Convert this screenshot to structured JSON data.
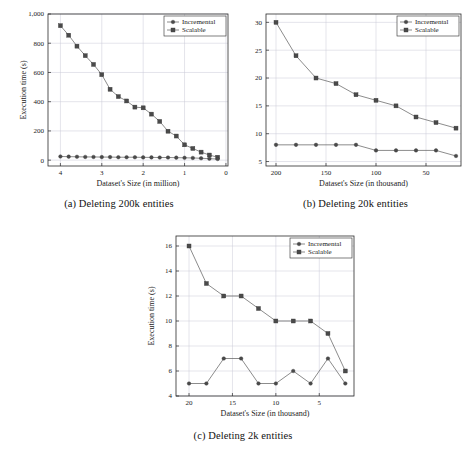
{
  "document": {
    "type": "figure-group",
    "colors": {
      "line": "#5a5a5a",
      "marker": "#4a4a4a",
      "grid": "#c9c9d6",
      "axis": "#2b2b2b",
      "background": "#ffffff"
    }
  },
  "figures": [
    {
      "id": "fig-a",
      "caption": "(a) Deleting 200k entities",
      "chart_data": {
        "type": "line",
        "title": "",
        "xlabel": "Dataset's Size (in million)",
        "ylabel": "Execution time (s)",
        "xlim": [
          4.3,
          -0.05
        ],
        "ylim": [
          -40,
          1000
        ],
        "xticks": [
          4,
          3,
          2,
          1,
          0
        ],
        "xticklabels": [
          "4",
          "3",
          "2",
          "1",
          "0"
        ],
        "yticks": [
          0,
          200,
          400,
          600,
          800,
          1000
        ],
        "yticklabels": [
          "0",
          "200",
          "400",
          "600",
          "800",
          "1,000"
        ],
        "grid": true,
        "legend_position": "top-right",
        "x": [
          4.0,
          3.8,
          3.6,
          3.4,
          3.2,
          3.0,
          2.8,
          2.6,
          2.4,
          2.2,
          2.0,
          1.8,
          1.6,
          1.4,
          1.2,
          1.0,
          0.8,
          0.6,
          0.4,
          0.2
        ],
        "series": [
          {
            "name": "Scalable",
            "marker": "square",
            "values": [
              920,
              855,
              780,
              715,
              655,
              585,
              485,
              435,
              405,
              363,
              358,
              315,
              265,
              198,
              165,
              105,
              80,
              55,
              35,
              20
            ]
          },
          {
            "name": "Incremental",
            "marker": "circle",
            "values": [
              25,
              24,
              23,
              22,
              22,
              21,
              21,
              20,
              20,
              20,
              19,
              19,
              18,
              18,
              17,
              16,
              15,
              13,
              10,
              8
            ]
          }
        ]
      }
    },
    {
      "id": "fig-b",
      "caption": "(b) Deleting 20k entities",
      "chart_data": {
        "type": "line",
        "title": "",
        "xlabel": "Dataset's Size (in thousand)",
        "ylabel": "",
        "xlim": [
          210,
          15
        ],
        "ylim": [
          4.2,
          31.5
        ],
        "xticks": [
          200,
          150,
          100,
          50
        ],
        "xticklabels": [
          "200",
          "150",
          "100",
          "50"
        ],
        "yticks": [
          5,
          10,
          15,
          20,
          25,
          30
        ],
        "yticklabels": [
          "5",
          "10",
          "15",
          "20",
          "25",
          "30"
        ],
        "grid": true,
        "legend_position": "top-right",
        "x": [
          200,
          180,
          160,
          140,
          120,
          100,
          80,
          60,
          40,
          20
        ],
        "series": [
          {
            "name": "Scalable",
            "marker": "square",
            "values": [
              30,
              24,
              20,
              19,
              17,
              16,
              15,
              13,
              12,
              11
            ]
          },
          {
            "name": "Incremental",
            "marker": "circle",
            "values": [
              8,
              8,
              8,
              8,
              8,
              7,
              7,
              7,
              7,
              6
            ]
          }
        ]
      }
    },
    {
      "id": "fig-c",
      "caption": "(c) Deleting 2k entities",
      "chart_data": {
        "type": "line",
        "title": "",
        "xlabel": "Dataset's Size (in thousand)",
        "ylabel": "Execution time (s)",
        "xlim": [
          21.5,
          1.0
        ],
        "ylim": [
          4,
          16.8
        ],
        "xticks": [
          20,
          15,
          10,
          5
        ],
        "xticklabels": [
          "20",
          "15",
          "10",
          "5"
        ],
        "yticks": [
          4,
          6,
          8,
          10,
          12,
          14,
          16
        ],
        "yticklabels": [
          "4",
          "6",
          "8",
          "10",
          "12",
          "14",
          "16"
        ],
        "grid": true,
        "legend_position": "top-right",
        "x": [
          20,
          18,
          16,
          14,
          12,
          10,
          8,
          6,
          4,
          2
        ],
        "series": [
          {
            "name": "Scalable",
            "marker": "square",
            "values": [
              16,
              13,
              12,
              12,
              11,
              10,
              10,
              10,
              9,
              6
            ]
          },
          {
            "name": "Incremental",
            "marker": "circle",
            "values": [
              5,
              5,
              7,
              7,
              5,
              5,
              6,
              5,
              7,
              5
            ]
          }
        ]
      }
    }
  ],
  "legend": {
    "incremental_label": "Incremental",
    "scalable_label": "Scalable"
  }
}
